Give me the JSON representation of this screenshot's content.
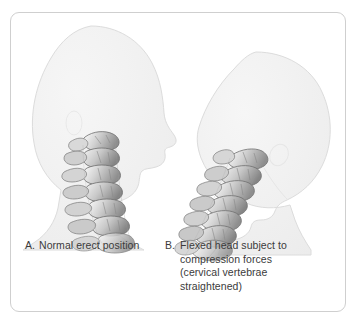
{
  "figure": {
    "border_color": "#cfcfcf",
    "background_color": "#ffffff",
    "body_fill": "#f1f1f1",
    "body_stroke": "#d8d8d8",
    "bone_light": "#e8e8e8",
    "bone_mid": "#b9b9b9",
    "bone_dark": "#7a7a7a",
    "bone_outline": "#6e6e6e",
    "text_color": "#3b3b3b"
  },
  "panels": [
    {
      "id": "panel-a",
      "marker": "A.",
      "lines": [
        "Normal erect position"
      ],
      "figure_name": "normal-erect-posture-figure",
      "spine_description": "lordotic curved cervical vertebrae",
      "head_position": "upright, facing right"
    },
    {
      "id": "panel-b",
      "marker": "B.",
      "lines": [
        "Flexed head subject to",
        "compression forces",
        "(cervical vertebrae",
        "straightened)"
      ],
      "figure_name": "flexed-head-posture-figure",
      "spine_description": "straightened diagonal cervical vertebrae",
      "head_position": "flexed forward and down, facing right"
    }
  ]
}
